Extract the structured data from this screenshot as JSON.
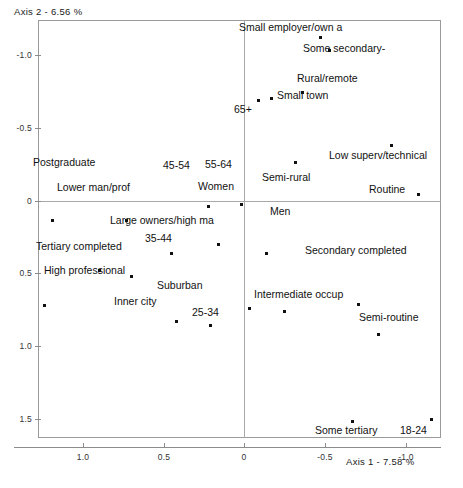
{
  "chart_data": {
    "type": "scatter",
    "title": "",
    "xlabel": "Axis 1  -  7.58 %",
    "ylabel": "Axis 2  -  6.56 %",
    "xlim": [
      1.28,
      -1.22
    ],
    "ylim": [
      -1.24,
      1.63
    ],
    "x_inverted": true,
    "y_inverted": true,
    "grid": false,
    "legend": "none",
    "xticks": [
      1.0,
      0.5,
      0,
      -0.5,
      -1.0
    ],
    "xtick_labels": [
      "1.0",
      "0.5",
      "0",
      "-0.5",
      "-1.0"
    ],
    "yticks": [
      -1.0,
      -0.5,
      0,
      0.5,
      1.0,
      1.5
    ],
    "ytick_labels": [
      "-1.0",
      "-0.5",
      "0",
      "0.5",
      "1.0",
      "1.5"
    ],
    "points": [
      {
        "label": "Small employer/own a",
        "x": -0.47,
        "y": -1.12,
        "lx": 239,
        "ly": 22,
        "anchor": "left"
      },
      {
        "label": "Some secondary-",
        "x": -0.53,
        "y": -1.03,
        "lx": 303,
        "ly": 43,
        "anchor": "left"
      },
      {
        "label": "Rural/remote",
        "x": -0.36,
        "y": -0.74,
        "lx": 297,
        "ly": 73,
        "anchor": "left"
      },
      {
        "label": "Small town",
        "x": -0.17,
        "y": -0.7,
        "lx": 277,
        "ly": 90,
        "anchor": "left"
      },
      {
        "label": "65+",
        "x": -0.09,
        "y": -0.69,
        "lx": 234,
        "ly": 104,
        "anchor": "left"
      },
      {
        "label": "Low superv/technical",
        "x": -0.91,
        "y": -0.38,
        "lx": 329,
        "ly": 150,
        "anchor": "left"
      },
      {
        "label": "Semi-rural",
        "x": -0.32,
        "y": -0.26,
        "lx": 262,
        "ly": 172,
        "anchor": "left"
      },
      {
        "label": "Routine",
        "x": -1.08,
        "y": -0.04,
        "lx": 369,
        "ly": 184,
        "anchor": "left"
      },
      {
        "label": "Postgraduate",
        "x": 1.19,
        "y": 0.14,
        "lx": 33,
        "ly": 157,
        "anchor": "left"
      },
      {
        "label": "Lower man/prof",
        "x": 0.73,
        "y": 0.14,
        "lx": 57,
        "ly": 182,
        "anchor": "left"
      },
      {
        "label": "45-54",
        "x": 0.22,
        "y": 0.04,
        "lx": 163,
        "ly": 160,
        "anchor": "left"
      },
      {
        "label": "55-64",
        "x": 0.02,
        "y": 0.03,
        "lx": 205,
        "ly": 159,
        "anchor": "left"
      },
      {
        "label": "Women",
        "x": 0.16,
        "y": 0.3,
        "lx": 198,
        "ly": 181,
        "anchor": "left"
      },
      {
        "label": "Men",
        "x": -0.14,
        "y": 0.36,
        "lx": 270,
        "ly": 206,
        "anchor": "left"
      },
      {
        "label": "Large owners/high ma",
        "x": 0.45,
        "y": 0.36,
        "lx": 110,
        "ly": 215,
        "anchor": "left"
      },
      {
        "label": "35-44",
        "x": 0.7,
        "y": 0.52,
        "lx": 145,
        "ly": 233,
        "anchor": "left"
      },
      {
        "label": "Tertiary completed",
        "x": 0.9,
        "y": 0.48,
        "lx": 36,
        "ly": 241,
        "anchor": "left"
      },
      {
        "label": "Secondary completed",
        "x": -0.71,
        "y": 0.71,
        "lx": 305,
        "ly": 245,
        "anchor": "left"
      },
      {
        "label": "High professional",
        "x": 1.24,
        "y": 0.72,
        "lx": 44,
        "ly": 265,
        "anchor": "left"
      },
      {
        "label": "Suburban",
        "x": -0.03,
        "y": 0.74,
        "lx": 157,
        "ly": 280,
        "anchor": "left"
      },
      {
        "label": "Intermediate occup",
        "x": -0.25,
        "y": 0.76,
        "lx": 254,
        "ly": 289,
        "anchor": "left"
      },
      {
        "label": "Inner city",
        "x": 0.42,
        "y": 0.83,
        "lx": 114,
        "ly": 296,
        "anchor": "left"
      },
      {
        "label": "25-34",
        "x": 0.21,
        "y": 0.86,
        "lx": 192,
        "ly": 307,
        "anchor": "left"
      },
      {
        "label": "Semi-routine",
        "x": -0.83,
        "y": 0.92,
        "lx": 359,
        "ly": 312,
        "anchor": "left"
      },
      {
        "label": "Some tertiary",
        "x": -0.67,
        "y": 1.52,
        "lx": 315,
        "ly": 425,
        "anchor": "left"
      },
      {
        "label": "18-24",
        "x": -1.16,
        "y": 1.5,
        "lx": 400,
        "ly": 425,
        "anchor": "left"
      }
    ]
  }
}
